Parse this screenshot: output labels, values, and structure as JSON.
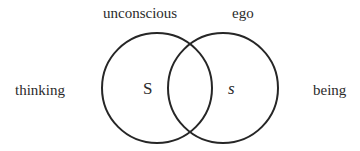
{
  "diagram": {
    "type": "venn",
    "labels": {
      "top_left": "unconscious",
      "top_right": "ego",
      "left": "thinking",
      "right": "being"
    },
    "sets": [
      {
        "id": "left",
        "letter": "S",
        "italic": false,
        "cx": 157,
        "cy": 88,
        "r": 55
      },
      {
        "id": "right",
        "letter": "s",
        "italic": true,
        "cx": 223,
        "cy": 88,
        "r": 55
      }
    ],
    "stroke_color": "#262626",
    "background": "#ffffff"
  }
}
